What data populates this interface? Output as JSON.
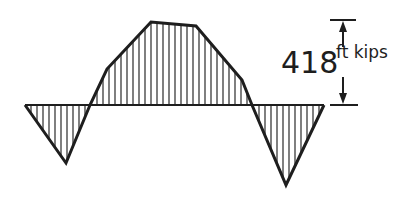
{
  "diagram": {
    "type": "bending-moment-diagram",
    "stroke_color": "#1e1e1e",
    "hatch_color": "#2a2a2a",
    "baseline": {
      "y": 105,
      "x_start": 25,
      "x_end": 324
    },
    "outline_points": [
      [
        25,
        105
      ],
      [
        66,
        163
      ],
      [
        90,
        105
      ],
      [
        107,
        69
      ],
      [
        151,
        22
      ],
      [
        196,
        26
      ],
      [
        242,
        80
      ],
      [
        252,
        105
      ],
      [
        286,
        185
      ],
      [
        324,
        105
      ]
    ],
    "hatch_spacing": 6,
    "dimension": {
      "value": "418",
      "unit": "ft kips",
      "x": 343,
      "top_y": 20,
      "bottom_y": 105
    }
  }
}
